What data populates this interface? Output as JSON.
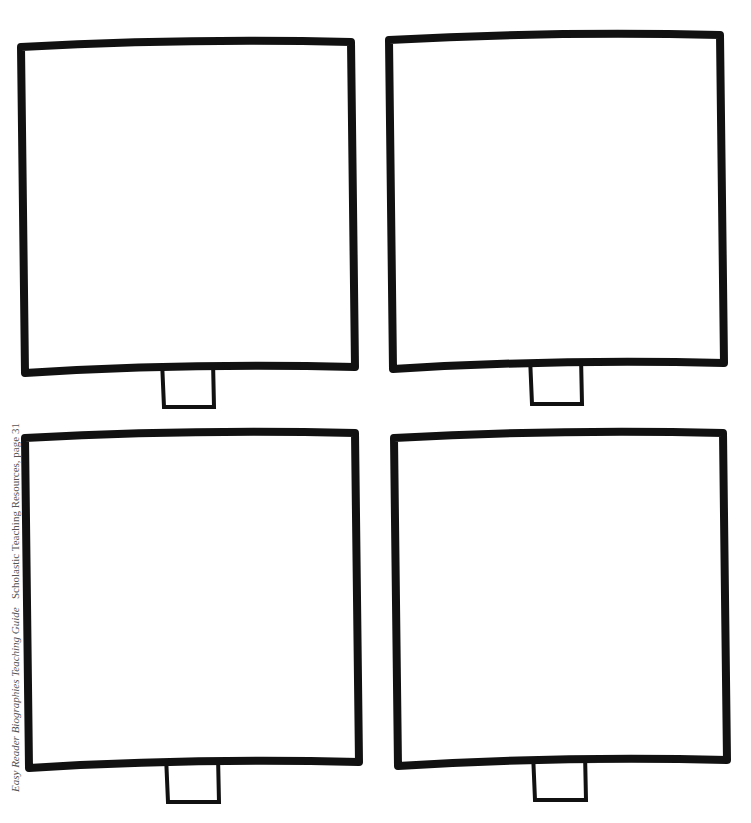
{
  "header": {
    "partial_title": ""
  },
  "panels": [
    {
      "id": "top-left",
      "x": 17,
      "y": 42,
      "w": 336,
      "h": 329,
      "tab": {
        "x": 162,
        "y": 361,
        "w": 52,
        "h": 46
      }
    },
    {
      "id": "top-right",
      "x": 385,
      "y": 35,
      "w": 337,
      "h": 332,
      "tab": {
        "x": 530,
        "y": 357,
        "w": 52,
        "h": 47
      }
    },
    {
      "id": "bottom-left",
      "x": 21,
      "y": 433,
      "w": 336,
      "h": 333,
      "tab": {
        "x": 166,
        "y": 756,
        "w": 53,
        "h": 46
      }
    },
    {
      "id": "bottom-right",
      "x": 390,
      "y": 433,
      "w": 335,
      "h": 331,
      "tab": {
        "x": 533,
        "y": 753,
        "w": 53,
        "h": 47
      }
    }
  ],
  "footer": {
    "credit_italic": "Easy Reader Biographies Teaching Guide",
    "credit_plain": "Scholastic Teaching Resources, page 31"
  },
  "colors": {
    "ink": "#111111",
    "paper": "#ffffff"
  }
}
